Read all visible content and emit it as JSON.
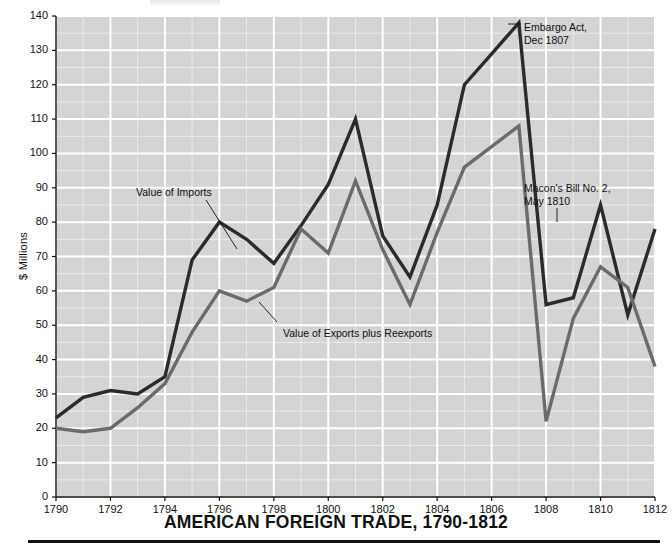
{
  "chart_data": {
    "type": "line",
    "title": "AMERICAN FOREIGN TRADE, 1790-1812",
    "xlabel": "",
    "ylabel": "$ Millions",
    "xlim": [
      1790,
      1812
    ],
    "ylim": [
      0,
      140
    ],
    "grid": true,
    "legend_position": "inline-annotations",
    "x": [
      1790,
      1791,
      1792,
      1793,
      1794,
      1795,
      1796,
      1797,
      1798,
      1799,
      1800,
      1801,
      1802,
      1803,
      1804,
      1805,
      1806,
      1807,
      1808,
      1809,
      1810,
      1811,
      1812
    ],
    "y_ticks": [
      0,
      10,
      20,
      30,
      40,
      50,
      60,
      70,
      80,
      90,
      100,
      110,
      120,
      130,
      140
    ],
    "x_ticks": [
      1790,
      1792,
      1794,
      1796,
      1798,
      1800,
      1802,
      1804,
      1806,
      1808,
      1810,
      1812
    ],
    "series": [
      {
        "name": "Value of Imports",
        "color": "#2b2b2b",
        "values": [
          23,
          29,
          31,
          30,
          35,
          69,
          80,
          75,
          68,
          79,
          91,
          110,
          76,
          64,
          85,
          120,
          129,
          138,
          56,
          58,
          85,
          53,
          78
        ]
      },
      {
        "name": "Value of Exports plus Reexports",
        "color": "#6b6b6b",
        "values": [
          20,
          19,
          20,
          26,
          33,
          48,
          60,
          57,
          61,
          78,
          71,
          92,
          72,
          56,
          77,
          96,
          102,
          108,
          22,
          52,
          67,
          61,
          38
        ]
      }
    ],
    "annotations": [
      {
        "id": "imports-label",
        "text": "Value of Imports"
      },
      {
        "id": "exports-label",
        "text": "Value of Exports plus Reexports"
      },
      {
        "id": "embargo-act",
        "text": "Embargo Act,",
        "text2": "Dec 1807"
      },
      {
        "id": "macons-bill",
        "text": "Macon's Bill No. 2,",
        "text2": "May 1810"
      }
    ]
  },
  "axis": {
    "y_label": "$ Millions",
    "y_ticks": [
      "140",
      "130",
      "120",
      "110",
      "100",
      "90",
      "80",
      "70",
      "60",
      "50",
      "40",
      "30",
      "20",
      "10",
      "0"
    ],
    "x_ticks": [
      "1790",
      "1792",
      "1794",
      "1796",
      "1798",
      "1800",
      "1802",
      "1804",
      "1806",
      "1808",
      "1810",
      "1812"
    ]
  },
  "annotations": {
    "imports": "Value of Imports",
    "exports": "Value of Exports plus Reexports",
    "embargo_line1": "Embargo Act,",
    "embargo_line2": "Dec 1807",
    "macon_line1": "Macon's Bill No. 2,",
    "macon_line2": "May 1810"
  },
  "title": "AMERICAN FOREIGN TRADE, 1790-1812",
  "colors": {
    "plot_background": "#d4d4d4",
    "gridline": "#ffffff",
    "imports_line": "#2b2b2b",
    "exports_line": "#6b6b6b",
    "text": "#111111",
    "rule": "#111111"
  }
}
